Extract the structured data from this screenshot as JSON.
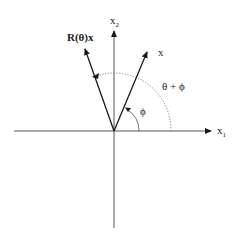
{
  "diagram": {
    "axes": {
      "x1_label": "x",
      "x1_sub": "1",
      "x2_label": "x",
      "x2_sub": "2"
    },
    "vectors": {
      "original_label": "x",
      "rotated_label": "R(θ)x"
    },
    "angles": {
      "phi_label": "ϕ",
      "sum_label": "θ + ϕ"
    },
    "colors": {
      "line": "#1a1a1a",
      "dotted": "#777777",
      "background": "#ffffff"
    }
  }
}
